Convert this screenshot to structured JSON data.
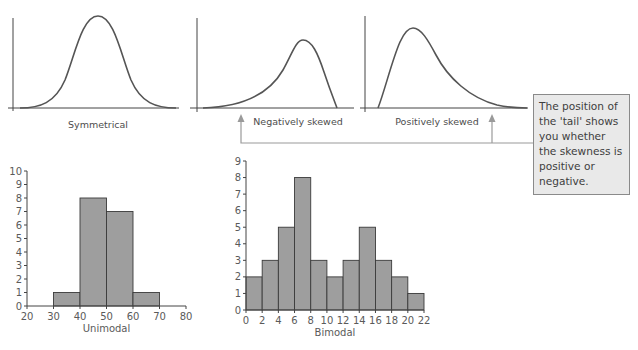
{
  "colors": {
    "curve": "#555555",
    "axis": "#444444",
    "bar_fill": "#9e9e9e",
    "bar_stroke": "#3a3a3a",
    "arrow": "#9a9a9a",
    "callout_bg": "#e9e9e9",
    "callout_border": "#8a8a8a"
  },
  "distribution_shapes": {
    "symmetrical": {
      "label": "Symmetrical"
    },
    "negative": {
      "label": "Negatively skewed"
    },
    "positive": {
      "label": "Positively skewed"
    }
  },
  "callout": {
    "text": "The position of the 'tail' shows you whether the skewness is positive or negative."
  },
  "chart_data": [
    {
      "type": "line",
      "title": "Symmetrical",
      "description": "Bell-shaped symmetrical distribution curve, peak in the centre",
      "xlabel": "Symmetrical",
      "ylabel": "",
      "grid": false
    },
    {
      "type": "line",
      "title": "Negatively skewed",
      "description": "Distribution curve with long tail to the left, peak towards the right",
      "xlabel": "Negatively skewed",
      "ylabel": "",
      "grid": false
    },
    {
      "type": "line",
      "title": "Positively skewed",
      "description": "Distribution curve with long tail to the right, peak towards the left",
      "xlabel": "Positively skewed",
      "ylabel": "",
      "grid": false
    },
    {
      "type": "bar",
      "title": "Unimodal",
      "xlabel": "Unimodal",
      "ylabel": "",
      "bins": [
        [
          30,
          40
        ],
        [
          40,
          50
        ],
        [
          50,
          60
        ],
        [
          60,
          70
        ]
      ],
      "values": [
        1,
        8,
        7,
        1
      ],
      "xticks": [
        20,
        30,
        40,
        50,
        60,
        70,
        80
      ],
      "yticks": [
        0,
        1,
        2,
        3,
        4,
        5,
        6,
        7,
        8,
        9,
        10
      ],
      "xlim": [
        20,
        80
      ],
      "ylim": [
        0,
        10
      ],
      "grid": false
    },
    {
      "type": "bar",
      "title": "Bimodal",
      "xlabel": "Bimodal",
      "ylabel": "",
      "bins": [
        [
          0,
          2
        ],
        [
          2,
          4
        ],
        [
          4,
          6
        ],
        [
          6,
          8
        ],
        [
          8,
          10
        ],
        [
          10,
          12
        ],
        [
          12,
          14
        ],
        [
          14,
          16
        ],
        [
          16,
          18
        ],
        [
          18,
          20
        ],
        [
          20,
          22
        ]
      ],
      "values": [
        2,
        3,
        5,
        8,
        3,
        2,
        3,
        5,
        3,
        2,
        1
      ],
      "xticks": [
        0,
        2,
        4,
        6,
        8,
        10,
        12,
        14,
        16,
        18,
        20,
        22
      ],
      "yticks": [
        0,
        1,
        2,
        3,
        4,
        5,
        6,
        7,
        8,
        9
      ],
      "xlim": [
        0,
        22
      ],
      "ylim": [
        0,
        9
      ],
      "grid": false
    }
  ]
}
